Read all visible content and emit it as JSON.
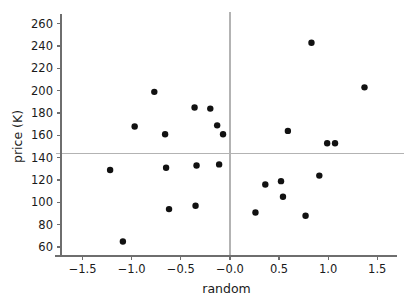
{
  "chart_data": {
    "type": "scatter",
    "title": "",
    "xlabel": "random",
    "ylabel": "price (K)",
    "xlim": [
      -1.72,
      1.65
    ],
    "ylim": [
      52,
      266
    ],
    "grid": false,
    "legend": null,
    "xticks": [
      -1.5,
      -1.0,
      -0.5,
      -0.0,
      0.5,
      1.0,
      1.5
    ],
    "xticklabels": [
      "−1.5",
      "−1.0",
      "−0.5",
      "−0.0",
      "0.5",
      "1.0",
      "1.5"
    ],
    "yticks": [
      60,
      80,
      100,
      120,
      140,
      160,
      180,
      200,
      220,
      240,
      260
    ],
    "yticklabels": [
      "60",
      "80",
      "100",
      "120",
      "140",
      "160",
      "180",
      "200",
      "220",
      "240",
      "260"
    ],
    "reference_lines": [
      {
        "orientation": "horizontal",
        "value": 144,
        "color": "#b3b3b3"
      },
      {
        "orientation": "vertical",
        "value": 0.0,
        "color": "#b3b3b3"
      }
    ],
    "marker": {
      "shape": "circle",
      "color": "#111111",
      "size": 3.2
    },
    "points": [
      {
        "x": -1.22,
        "y": 129
      },
      {
        "x": -1.09,
        "y": 65
      },
      {
        "x": -0.97,
        "y": 168
      },
      {
        "x": -0.77,
        "y": 199
      },
      {
        "x": -0.66,
        "y": 161
      },
      {
        "x": -0.65,
        "y": 131
      },
      {
        "x": -0.62,
        "y": 94
      },
      {
        "x": -0.36,
        "y": 185
      },
      {
        "x": -0.35,
        "y": 97
      },
      {
        "x": -0.34,
        "y": 133
      },
      {
        "x": -0.2,
        "y": 184
      },
      {
        "x": -0.13,
        "y": 169
      },
      {
        "x": -0.11,
        "y": 134
      },
      {
        "x": -0.07,
        "y": 161
      },
      {
        "x": 0.26,
        "y": 91
      },
      {
        "x": 0.36,
        "y": 116
      },
      {
        "x": 0.52,
        "y": 119
      },
      {
        "x": 0.54,
        "y": 105
      },
      {
        "x": 0.59,
        "y": 164
      },
      {
        "x": 0.77,
        "y": 88
      },
      {
        "x": 0.83,
        "y": 243
      },
      {
        "x": 0.91,
        "y": 124
      },
      {
        "x": 0.99,
        "y": 153
      },
      {
        "x": 1.07,
        "y": 153
      },
      {
        "x": 1.37,
        "y": 203
      }
    ]
  }
}
